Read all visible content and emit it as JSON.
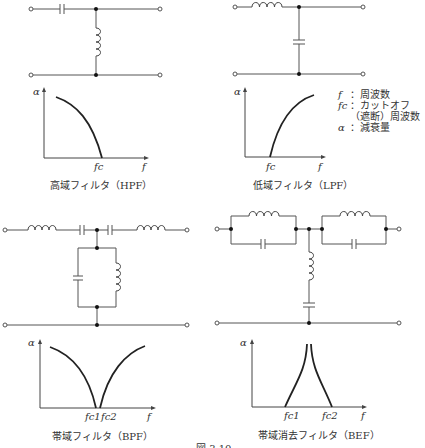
{
  "figure": {
    "caption": "図 3.10",
    "legend": [
      {
        "symbol": "f",
        "text": "：周波数"
      },
      {
        "symbol": "fc",
        "text": "：カットオフ"
      },
      {
        "symbol": "",
        "text": "（遮断）周波数"
      },
      {
        "symbol": "α",
        "text": "：減衰量"
      }
    ],
    "panels": [
      {
        "id": "hpf",
        "title": "高域フィルタ（HPF）",
        "y_label": "α",
        "x_label": "f",
        "cutoff_labels": [
          "fc"
        ]
      },
      {
        "id": "lpf",
        "title": "低域フィルタ（LPF）",
        "y_label": "α",
        "x_label": "f",
        "cutoff_labels": [
          "fc"
        ]
      },
      {
        "id": "bpf",
        "title": "帯域フィルタ（BPF）",
        "y_label": "α",
        "x_label": "f",
        "cutoff_labels": [
          "fc1",
          "fc2"
        ]
      },
      {
        "id": "bef",
        "title": "帯域消去フィルタ（BEF）",
        "y_label": "α",
        "x_label": "f",
        "cutoff_labels": [
          "fc1",
          "fc2"
        ]
      }
    ]
  }
}
